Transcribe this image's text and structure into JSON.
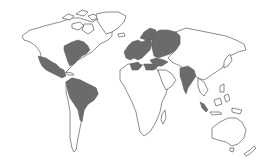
{
  "map": {
    "type": "world-outline-choropleth",
    "colors": {
      "background": "#ffffff",
      "outline": "#5a5a5a",
      "highlight": "#6b6b6b",
      "land": "#ffffff"
    },
    "highlighted_regions": [
      "eastern-united-states",
      "mexico-central-america",
      "northern-south-america",
      "western-europe",
      "scandinavia",
      "european-russia",
      "eastern-europe-balkans",
      "turkey",
      "north-africa-maghreb",
      "libya-egypt-coast",
      "india",
      "sumatra"
    ],
    "unshaded_regions": [
      "canada-arctic",
      "greenland",
      "southern-south-america",
      "sub-saharan-africa",
      "arabia",
      "siberia",
      "china-east-asia",
      "southeast-asia",
      "australia",
      "new-zealand"
    ]
  }
}
